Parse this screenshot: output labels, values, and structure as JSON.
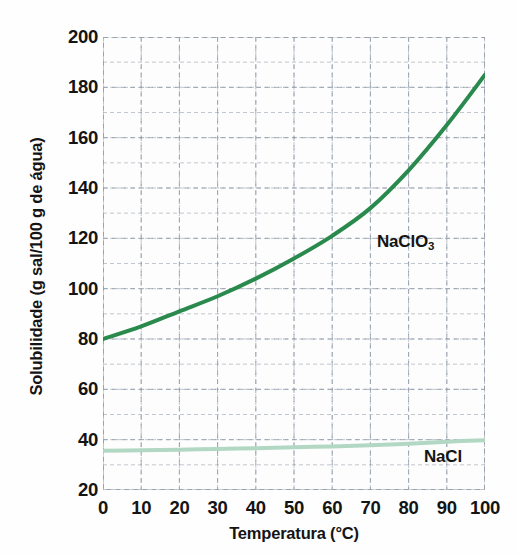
{
  "chart_data": {
    "type": "line",
    "title": "",
    "xlabel": "Temperatura (°C)",
    "ylabel": "Solubilidade (g sal/100 g de água)",
    "xlim": [
      0,
      100
    ],
    "ylim": [
      20,
      200
    ],
    "xticks": [
      0,
      10,
      20,
      30,
      40,
      50,
      60,
      70,
      80,
      90,
      100
    ],
    "yticks": [
      20,
      40,
      60,
      80,
      100,
      120,
      140,
      160,
      180,
      200
    ],
    "xtick_labels": [
      "0",
      "10",
      "20",
      "30",
      "40",
      "50",
      "60",
      "70",
      "80",
      "90",
      "100"
    ],
    "ytick_labels": [
      "20",
      "40",
      "60",
      "80",
      "100",
      "120",
      "140",
      "160",
      "180",
      "200"
    ],
    "grid": true,
    "grid_style": "dashed",
    "grid_minor_step_x": 10,
    "grid_minor_step_y": 10,
    "legend_position": "inline-annotation",
    "x": [
      0,
      10,
      20,
      30,
      40,
      50,
      60,
      70,
      80,
      90,
      100
    ],
    "series": [
      {
        "name": "NaClO3",
        "label_html": "NaClO<sub>3</sub>",
        "color": "#2a8a4d",
        "linewidth": 4,
        "values": [
          80,
          85,
          91,
          97,
          104,
          112,
          121,
          132,
          147,
          165,
          185
        ]
      },
      {
        "name": "NaCl",
        "label_html": "NaCl",
        "color": "#b2d8c4",
        "linewidth": 4,
        "values": [
          35.6,
          35.8,
          36.0,
          36.3,
          36.6,
          37.0,
          37.3,
          37.8,
          38.4,
          39.2,
          39.8
        ]
      }
    ],
    "annotations": [
      {
        "name": "naclo3-label",
        "text": "NaClO3",
        "x": 73,
        "y": 125
      },
      {
        "name": "nacl-label",
        "text": "NaCl",
        "x": 86,
        "y": 32
      }
    ]
  },
  "axes": {
    "y_title": "Solubilidade (g sal/100 g de água)",
    "x_title": "Temperatura (°C)",
    "frame_color": "#9a9a9a",
    "grid_color": "#8f9aa8"
  },
  "colors": {
    "background": "#ffffff",
    "plot_background": "#fdfdfd",
    "text": "#141414",
    "naclo3": "#2a8a4d",
    "nacl": "#b2d8c4",
    "grid": "#8f9aa8"
  }
}
